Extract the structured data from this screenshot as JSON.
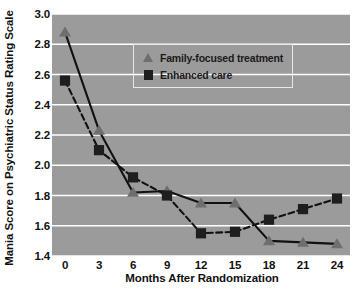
{
  "chart_data": {
    "type": "line",
    "title": "",
    "xlabel": "Months After Randomization",
    "ylabel": "Mania Score on Psychiatric Status Rating Scale",
    "x": [
      0,
      3,
      6,
      9,
      12,
      15,
      18,
      21,
      24
    ],
    "xtick_labels": [
      "0",
      "3",
      "6",
      "9",
      "12",
      "15",
      "18",
      "21",
      "24"
    ],
    "ytick_labels": [
      "1.4",
      "1.6",
      "1.8",
      "2.0",
      "2.2",
      "2.4",
      "2.6",
      "2.8",
      "3.0"
    ],
    "ytick_values": [
      1.4,
      1.6,
      1.8,
      2.0,
      2.2,
      2.4,
      2.6,
      2.8,
      3.0
    ],
    "xlim": [
      0,
      24
    ],
    "ylim": [
      1.4,
      3.0
    ],
    "grid": "horizontal-white",
    "legend_position": "upper-right-inside",
    "plot_background": "#9b9b9b",
    "gridline_color": "#ffffff",
    "series": [
      {
        "name": "Family-focused treatment",
        "marker": "triangle",
        "marker_color": "#6e6e6e",
        "line_style": "solid",
        "line_color": "#111111",
        "values": [
          2.88,
          2.23,
          1.82,
          1.83,
          1.75,
          1.75,
          1.5,
          1.49,
          1.48
        ]
      },
      {
        "name": "Enhanced care",
        "marker": "square",
        "marker_color": "#1e1e1e",
        "line_style": "dashed",
        "line_color": "#111111",
        "values": [
          2.56,
          2.1,
          1.92,
          1.8,
          1.55,
          1.56,
          1.64,
          1.71,
          1.78
        ]
      }
    ]
  },
  "legend": {
    "items": [
      {
        "label": "Family-focused treatment",
        "marker": "triangle-marker-icon"
      },
      {
        "label": "Enhanced care",
        "marker": "square-marker-icon"
      }
    ]
  },
  "axes": {
    "x_title": "Months After Randomization",
    "y_title": "Mania Score on Psychiatric Status Rating Scale"
  }
}
